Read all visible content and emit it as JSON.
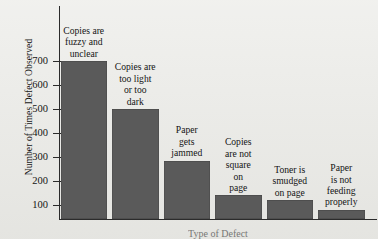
{
  "chart_data": {
    "type": "bar",
    "title": "",
    "xlabel": "Type of Defect",
    "ylabel": "Number of Times Defect Observed",
    "categories": [
      "Copies are fuzzy and unclear",
      "Copies are too light or too dark",
      "Paper gets jammed",
      "Copies are not square on page",
      "Toner is smudged on page",
      "Paper is not feeding properly"
    ],
    "values": [
      700,
      500,
      285,
      140,
      120,
      80
    ],
    "ylim": [
      0,
      760
    ],
    "yticks": [
      100,
      200,
      300,
      400,
      500,
      600,
      700
    ],
    "ytick_labels": [
      "100",
      "200",
      "300",
      "400",
      "500",
      "600",
      "700"
    ],
    "grid": false,
    "legend": null,
    "bar_color": "#5a5a5a",
    "axis_color": "#2b2b2b",
    "background_color": "#e9e9e5"
  },
  "axis": {
    "y_title": "Number of Times Defect Observed",
    "x_title": "Type of Defect"
  },
  "bar_labels": [
    [
      "Copies are",
      "fuzzy and",
      "unclear"
    ],
    [
      "Copies are",
      "too light",
      "or too",
      "dark"
    ],
    [
      "Paper",
      "gets",
      "jammed"
    ],
    [
      "Copies",
      "are not",
      "square",
      "on",
      "page"
    ],
    [
      "Toner is",
      "smudged",
      "on page"
    ],
    [
      "Paper",
      "is not",
      "feeding",
      "properly"
    ]
  ]
}
